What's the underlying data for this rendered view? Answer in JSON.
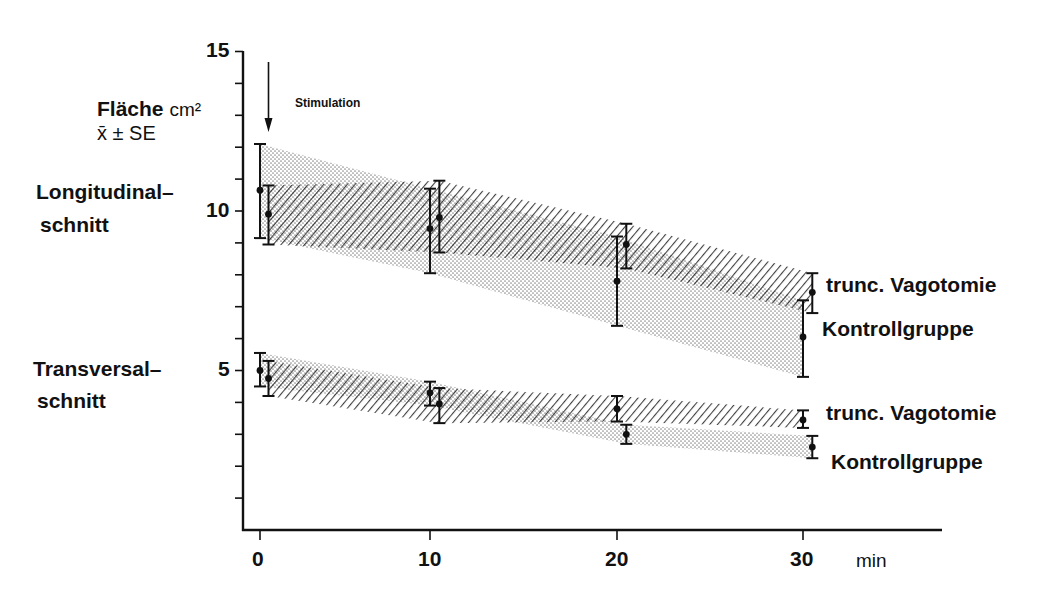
{
  "chart_data": {
    "type": "line",
    "title": "",
    "ylabel": "Fläche cm²",
    "ylabel_sub": "x̄ ± SE",
    "xlabel": "min",
    "xlim": [
      0,
      30
    ],
    "ylim": [
      0,
      15
    ],
    "x_ticks": [
      0,
      10,
      20,
      30
    ],
    "y_ticks_labeled": [
      5,
      10,
      15
    ],
    "y_minor_step": 1,
    "grid": false,
    "annotation": {
      "text": "Stimulation",
      "x": 0.5,
      "arrow": true
    },
    "groups": [
      {
        "name": "Longitudinalschnitt",
        "label_lines": [
          "Longitudinal-",
          "schnitt"
        ],
        "series": [
          {
            "name": "trunc. Vagotomie",
            "pattern": "hatched",
            "x": [
              0.5,
              10.5,
              20.5,
              30.5
            ],
            "mean": [
              9.9,
              9.8,
              8.95,
              7.45
            ],
            "upper": [
              10.8,
              10.95,
              9.6,
              8.05
            ],
            "lower": [
              8.95,
              8.7,
              8.2,
              6.8
            ]
          },
          {
            "name": "Kontrollgruppe",
            "pattern": "dotted",
            "x": [
              0,
              10,
              20,
              30
            ],
            "mean": [
              10.65,
              9.45,
              7.8,
              6.05
            ],
            "upper": [
              12.1,
              10.7,
              9.2,
              7.2
            ],
            "lower": [
              9.15,
              8.05,
              6.4,
              4.8
            ]
          }
        ]
      },
      {
        "name": "Transversalschnitt",
        "label_lines": [
          "Transversal-",
          "schnitt"
        ],
        "series": [
          {
            "name": "trunc. Vagotomie",
            "pattern": "hatched",
            "x": [
              0.5,
              10.5,
              20,
              30
            ],
            "mean": [
              4.75,
              3.95,
              3.8,
              3.45
            ],
            "upper": [
              5.3,
              4.45,
              4.2,
              3.75
            ],
            "lower": [
              4.2,
              3.35,
              3.4,
              3.2
            ]
          },
          {
            "name": "Kontrollgruppe",
            "pattern": "dotted",
            "x": [
              0,
              10,
              20.5,
              30.5
            ],
            "mean": [
              5.0,
              4.3,
              3.0,
              2.6
            ],
            "upper": [
              5.55,
              4.65,
              3.3,
              2.95
            ],
            "lower": [
              4.5,
              3.9,
              2.7,
              2.25
            ]
          }
        ]
      }
    ]
  },
  "labels": {
    "y_title": "Fläche",
    "y_unit": "cm²",
    "y_sub": "x̄ ± SE",
    "stimulation": "Stimulation",
    "long_1": "Longitudinal–",
    "long_2": "schnitt",
    "trans_1": "Transversal–",
    "trans_2": "schnitt",
    "legend_long_vago": "trunc. Vagotomie",
    "legend_long_ctrl": "Kontrollgruppe",
    "legend_trans_vago": "trunc. Vagotomie",
    "legend_trans_ctrl": "Kontrollgruppe",
    "y15": "15",
    "y10": "10",
    "y5": "5",
    "x0": "0",
    "x10": "10",
    "x20": "20",
    "x30": "30",
    "x_unit": "min"
  }
}
